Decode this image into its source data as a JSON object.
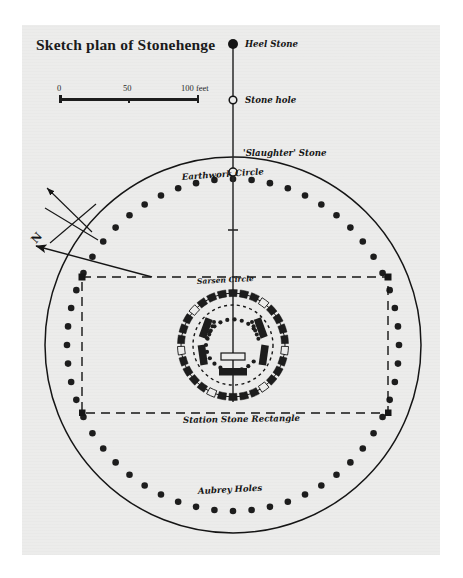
{
  "title": "Sketch plan of Stonehenge",
  "scale": {
    "labels": [
      "0",
      "50",
      "100 feet"
    ],
    "values": [
      0,
      50,
      100
    ],
    "unit": "feet"
  },
  "compass": {
    "label": "N",
    "name": "north-arrow"
  },
  "labels": {
    "heel_stone": "Heel Stone",
    "stone_hole": "Stone hole",
    "slaughter_stone": "'Slaughter' Stone",
    "earthwork_circle": "Earthwork Circle",
    "sarsen_circle": "Sarsen Circle",
    "station_stone_rectangle": "Station Stone Rectangle",
    "aubrey_holes": "Aubrey Holes"
  },
  "colors": {
    "paper": "#ececeb",
    "ink": "#151515",
    "stone_fill": "#1d1d1d",
    "page": "#ffffff"
  },
  "chart_data": {
    "type": "diagram",
    "title": "Sketch plan of Stonehenge",
    "center": [
      233,
      345
    ],
    "features": [
      {
        "name": "earthwork-circle",
        "kind": "circle",
        "radius": 188
      },
      {
        "name": "aubrey-holes",
        "kind": "dot-ring",
        "radius": 166,
        "count": 56
      },
      {
        "name": "station-stone-rectangle",
        "kind": "rectangle",
        "corners": [
          [
            82,
            277
          ],
          [
            388,
            277
          ],
          [
            388,
            413
          ],
          [
            82,
            413
          ]
        ]
      },
      {
        "name": "sarsen-circle",
        "kind": "segmented-ring",
        "radius": 52,
        "count": 30
      },
      {
        "name": "bluestone-circle",
        "kind": "dashed-circle",
        "radius": 40
      },
      {
        "name": "trilithon-horseshoe",
        "kind": "blocks",
        "count": 5
      },
      {
        "name": "bluestone-horseshoe",
        "kind": "dot-horseshoe",
        "count": 19
      },
      {
        "name": "altar-stone",
        "kind": "open-rectangle"
      },
      {
        "name": "slaughter-stone",
        "kind": "open-circle"
      },
      {
        "name": "stone-hole",
        "kind": "open-circle"
      },
      {
        "name": "heel-stone",
        "kind": "filled-circle"
      },
      {
        "name": "avenue-axis",
        "kind": "line"
      }
    ]
  }
}
